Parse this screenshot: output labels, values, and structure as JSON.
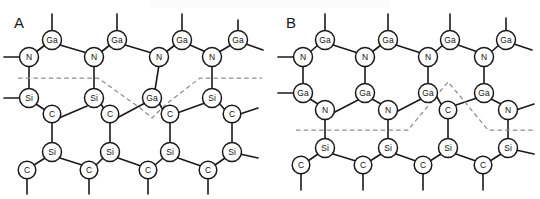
{
  "figure": {
    "background_color": "#ffffff",
    "bond_color": "#1a1a1a",
    "atom_fill_color": "#ffffff",
    "interface_line_color": "#8d8d8d",
    "type": "atomic-lattice-diagram"
  },
  "panels": [
    {
      "id": "A",
      "label": "A",
      "label_x": 14,
      "label_y": 28,
      "atoms": [
        {
          "label": "Ga",
          "x": 52,
          "y": 40
        },
        {
          "label": "Ga",
          "x": 117,
          "y": 40
        },
        {
          "label": "Ga",
          "x": 182,
          "y": 40
        },
        {
          "label": "Ga",
          "x": 238,
          "y": 40
        },
        {
          "label": "N",
          "x": 29,
          "y": 57
        },
        {
          "label": "N",
          "x": 94,
          "y": 57
        },
        {
          "label": "N",
          "x": 159,
          "y": 57
        },
        {
          "label": "N",
          "x": 212,
          "y": 57
        },
        {
          "label": "Si",
          "x": 29,
          "y": 98
        },
        {
          "label": "Si",
          "x": 94,
          "y": 98
        },
        {
          "label": "Ga",
          "x": 152,
          "y": 98
        },
        {
          "label": "Si",
          "x": 212,
          "y": 98
        },
        {
          "label": "C",
          "x": 52,
          "y": 114
        },
        {
          "label": "C",
          "x": 110,
          "y": 114
        },
        {
          "label": "C",
          "x": 170,
          "y": 114
        },
        {
          "label": "C",
          "x": 232,
          "y": 114
        },
        {
          "label": "Si",
          "x": 52,
          "y": 152
        },
        {
          "label": "Si",
          "x": 110,
          "y": 152
        },
        {
          "label": "Si",
          "x": 170,
          "y": 152
        },
        {
          "label": "Si",
          "x": 232,
          "y": 152
        },
        {
          "label": "C",
          "x": 27,
          "y": 170
        },
        {
          "label": "C",
          "x": 89,
          "y": 170
        },
        {
          "label": "C",
          "x": 148,
          "y": 170
        },
        {
          "label": "C",
          "x": 208,
          "y": 170
        }
      ],
      "interface_path": "M 18,78 L 98,78 L 140,108 L 152,118 L 165,105 L 200,78 L 262,78",
      "interface_shape": "valley"
    },
    {
      "id": "B",
      "label": "B",
      "label_x": 286,
      "label_y": 28,
      "atoms": [
        {
          "label": "Ga",
          "x": 325,
          "y": 40
        },
        {
          "label": "Ga",
          "x": 388,
          "y": 40
        },
        {
          "label": "Ga",
          "x": 450,
          "y": 40
        },
        {
          "label": "Ga",
          "x": 506,
          "y": 40
        },
        {
          "label": "N",
          "x": 303,
          "y": 57
        },
        {
          "label": "N",
          "x": 365,
          "y": 57
        },
        {
          "label": "N",
          "x": 428,
          "y": 57
        },
        {
          "label": "N",
          "x": 484,
          "y": 57
        },
        {
          "label": "Ga",
          "x": 303,
          "y": 93
        },
        {
          "label": "Ga",
          "x": 365,
          "y": 93
        },
        {
          "label": "Ga",
          "x": 428,
          "y": 93
        },
        {
          "label": "Ga",
          "x": 484,
          "y": 93
        },
        {
          "label": "N",
          "x": 325,
          "y": 110
        },
        {
          "label": "N",
          "x": 388,
          "y": 110
        },
        {
          "label": "C",
          "x": 448,
          "y": 110
        },
        {
          "label": "N",
          "x": 508,
          "y": 110
        },
        {
          "label": "Si",
          "x": 325,
          "y": 148
        },
        {
          "label": "Si",
          "x": 388,
          "y": 148
        },
        {
          "label": "Si",
          "x": 448,
          "y": 148
        },
        {
          "label": "Si",
          "x": 508,
          "y": 148
        },
        {
          "label": "C",
          "x": 301,
          "y": 165
        },
        {
          "label": "C",
          "x": 363,
          "y": 165
        },
        {
          "label": "C",
          "x": 423,
          "y": 165
        },
        {
          "label": "C",
          "x": 483,
          "y": 165
        }
      ],
      "interface_path": "M 296,130 L 408,130 L 437,95 L 448,82 L 460,96 L 488,130 L 534,130",
      "interface_shape": "peak"
    }
  ],
  "atom_species": [
    {
      "symbol": "Ga",
      "name": "gallium"
    },
    {
      "symbol": "N",
      "name": "nitrogen"
    },
    {
      "symbol": "Si",
      "name": "silicon"
    },
    {
      "symbol": "C",
      "name": "carbon"
    }
  ]
}
